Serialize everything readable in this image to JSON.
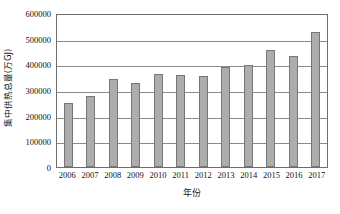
{
  "chart_data": {
    "type": "bar",
    "title": "",
    "xlabel": "年份",
    "ylabel": "集中供热总量(万GJ)",
    "categories": [
      "2006",
      "2007",
      "2008",
      "2009",
      "2010",
      "2011",
      "2012",
      "2013",
      "2014",
      "2015",
      "2016",
      "2017"
    ],
    "values": [
      248000,
      278000,
      342000,
      329000,
      362000,
      357000,
      354000,
      391000,
      398000,
      456000,
      432000,
      525000
    ],
    "series": [
      {
        "name": "集中供热总量",
        "values": [
          248000,
          278000,
          342000,
          329000,
          362000,
          357000,
          354000,
          391000,
          398000,
          456000,
          432000,
          525000
        ]
      }
    ],
    "ylim": [
      0,
      600000
    ],
    "yticks": [
      0,
      100000,
      200000,
      300000,
      400000,
      500000,
      600000
    ],
    "ytick_labels": [
      "0",
      "100000",
      "200000",
      "300000",
      "400000",
      "500000",
      "600000"
    ],
    "grid": true,
    "grid_axis": "y",
    "legend": false,
    "legend_position": "none",
    "bar_color": "#adadad",
    "bar_edge_color": "#777777",
    "gridline_color": "#8a8a8a",
    "axis_color": "#6e6e6e"
  }
}
